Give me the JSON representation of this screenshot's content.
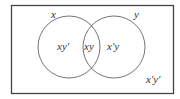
{
  "diagram": {
    "type": "venn",
    "universe_label": "x'y'",
    "sets": [
      {
        "name": "x",
        "label": "x"
      },
      {
        "name": "y",
        "label": "y"
      }
    ],
    "regions": {
      "only_x": "xy'",
      "intersection": "xy",
      "only_y": "x'y",
      "outside": "x'y'"
    },
    "colors": {
      "stroke": "#555555",
      "background": "#ffffff",
      "text": "#333333"
    }
  }
}
